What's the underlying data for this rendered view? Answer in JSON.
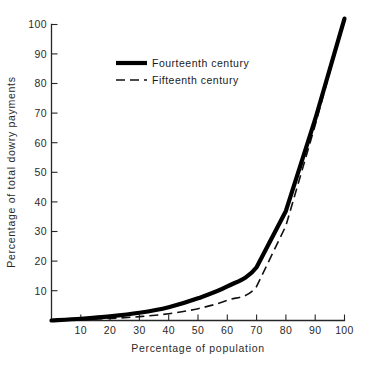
{
  "chart_data": {
    "type": "line",
    "title": "",
    "xlabel": "Percentage of population",
    "ylabel": "Percentage of total dowry payments",
    "xlim": [
      0,
      100
    ],
    "ylim": [
      0,
      100
    ],
    "xticks": [
      10,
      20,
      30,
      40,
      50,
      60,
      70,
      80,
      90,
      100
    ],
    "yticks": [
      10,
      20,
      30,
      40,
      50,
      60,
      70,
      80,
      90,
      100
    ],
    "xtick_labels": [
      "10",
      "20",
      "30",
      "40",
      "50",
      "60",
      "70",
      "80",
      "90",
      "100"
    ],
    "ytick_labels": [
      "10",
      "20",
      "30",
      "40",
      "50",
      "60",
      "70",
      "80",
      "90",
      "100"
    ],
    "grid": false,
    "legend_position": "upper-left-inside",
    "series": [
      {
        "name": "Fourteenth century",
        "style": "solid",
        "linewidth": "thick",
        "color": "#000000",
        "x": [
          0,
          10,
          20,
          30,
          40,
          50,
          60,
          70,
          80,
          90,
          100
        ],
        "values": [
          0,
          0.6,
          1.4,
          2.6,
          4.5,
          7.5,
          11.5,
          18,
          37,
          68,
          102
        ]
      },
      {
        "name": "Fifteenth century",
        "style": "dashed",
        "linewidth": "thin",
        "color": "#111111",
        "x": [
          0,
          10,
          20,
          30,
          40,
          50,
          60,
          70,
          80,
          90,
          100
        ],
        "values": [
          0,
          0.3,
          0.7,
          1.3,
          2.3,
          4.0,
          6.8,
          11.5,
          32,
          66,
          102
        ]
      }
    ]
  },
  "axes": {
    "x_label": "Percentage of population",
    "y_label": "Percentage of total dowry payments"
  },
  "legend": {
    "items": [
      {
        "label": "Fourteenth century",
        "style": "solid"
      },
      {
        "label": "Fifteenth century",
        "style": "dashed"
      }
    ]
  },
  "ticks": {
    "x": [
      "10",
      "20",
      "30",
      "40",
      "50",
      "60",
      "70",
      "80",
      "90",
      "100"
    ],
    "y": [
      "10",
      "20",
      "30",
      "40",
      "50",
      "60",
      "70",
      "80",
      "90",
      "100"
    ]
  }
}
